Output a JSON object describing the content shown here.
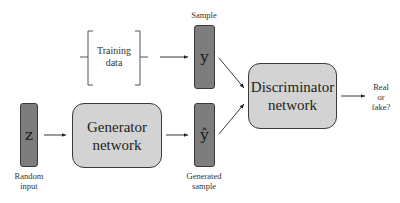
{
  "diagram": {
    "nodes": {
      "z": {
        "symbol": "z",
        "caption_line1": "Random",
        "caption_line2": "input"
      },
      "training_data": {
        "line1": "Training",
        "line2": "data"
      },
      "y": {
        "symbol": "y",
        "caption": "Sample"
      },
      "y_hat": {
        "symbol": "ŷ",
        "caption_line1": "Generated",
        "caption_line2": "sample"
      },
      "generator": {
        "line1": "Generator",
        "line2": "network"
      },
      "discriminator": {
        "line1": "Discriminator",
        "line2": "network"
      },
      "output": {
        "line1": "Real",
        "line2": "or",
        "line3": "fake?"
      }
    },
    "edges": [
      {
        "from": "z",
        "to": "generator"
      },
      {
        "from": "generator",
        "to": "y_hat"
      },
      {
        "from": "training_data",
        "to": "y"
      },
      {
        "from": "y",
        "to": "discriminator"
      },
      {
        "from": "y_hat",
        "to": "discriminator"
      },
      {
        "from": "discriminator",
        "to": "output"
      }
    ],
    "colors": {
      "vector_fill": "#7d7d7d",
      "network_fill": "#d3d3d3",
      "stroke": "#3a3a3a"
    }
  }
}
